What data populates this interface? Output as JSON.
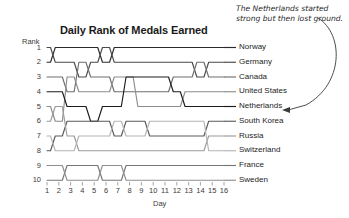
{
  "chart_data": {
    "type": "line",
    "subtype": "bump-chart",
    "title": "Daily Rank of Medals Earned",
    "xlabel": "Day",
    "ylabel": "Rank",
    "x": [
      1,
      2,
      3,
      4,
      5,
      6,
      7,
      8,
      9,
      10,
      11,
      12,
      13,
      14,
      15,
      16
    ],
    "xtick_labels": [
      "1",
      "2",
      "3",
      "4",
      "5",
      "6",
      "7",
      "8",
      "9",
      "10",
      "11",
      "12",
      "13",
      "14",
      "15",
      "16"
    ],
    "ytick_labels": [
      "1",
      "2",
      "3",
      "4",
      "5",
      "6",
      "7",
      "8",
      "9",
      "10"
    ],
    "ylim": [
      1,
      10
    ],
    "y_inverted": true,
    "grid": false,
    "legend": "right-inline-labels",
    "series": [
      {
        "name": "Norway",
        "color": "#2b2b2b",
        "final_rank": 1,
        "values": [
          2,
          1,
          1,
          1,
          1,
          2,
          1,
          1,
          1,
          1,
          1,
          1,
          1,
          1,
          1,
          1
        ]
      },
      {
        "name": "Germany",
        "color": "#4a4a4a",
        "final_rank": 2,
        "values": [
          1,
          2,
          2,
          3,
          2,
          1,
          2,
          2,
          2,
          2,
          2,
          2,
          2,
          3,
          2,
          2
        ]
      },
      {
        "name": "Canada",
        "color": "#6e6e6e",
        "final_rank": 3,
        "values": [
          3,
          3,
          4,
          2,
          3,
          3,
          4,
          4,
          4,
          4,
          4,
          3,
          3,
          2,
          3,
          3
        ]
      },
      {
        "name": "United States",
        "color": "#8c8c8c",
        "final_rank": 4,
        "values": [
          5,
          6,
          3,
          4,
          4,
          4,
          3,
          3,
          5,
          5,
          5,
          5,
          4,
          4,
          4,
          4
        ]
      },
      {
        "name": "Netherlands",
        "color": "#1c1c1c",
        "final_rank": 5,
        "values": [
          4,
          4,
          5,
          5,
          6,
          5,
          5,
          3,
          3,
          3,
          3,
          4,
          5,
          5,
          5,
          5
        ]
      },
      {
        "name": "South Korea",
        "color": "#5a5a5a",
        "final_rank": 6,
        "values": [
          8,
          7,
          6,
          6,
          6,
          6,
          7,
          6,
          6,
          7,
          7,
          7,
          7,
          7,
          6,
          6
        ]
      },
      {
        "name": "Russia",
        "color": "#9a9a9a",
        "final_rank": 7,
        "values": [
          6,
          5,
          7,
          8,
          8,
          8,
          8,
          8,
          8,
          8,
          8,
          8,
          8,
          8,
          7,
          7
        ]
      },
      {
        "name": "Switzerland",
        "color": "#b4b4b4",
        "final_rank": 8,
        "values": [
          7,
          8,
          8,
          7,
          7,
          7,
          6,
          7,
          7,
          6,
          6,
          6,
          6,
          6,
          8,
          8
        ]
      },
      {
        "name": "France",
        "color": "#767676",
        "final_rank": 9,
        "values": [
          10,
          10,
          9,
          9,
          9,
          10,
          10,
          9,
          9,
          9,
          9,
          9,
          9,
          9,
          9,
          9
        ]
      },
      {
        "name": "Sweden",
        "color": "#8f8f8f",
        "final_rank": 10,
        "values": [
          9,
          9,
          10,
          10,
          10,
          9,
          9,
          10,
          10,
          10,
          10,
          10,
          10,
          10,
          10,
          10
        ]
      }
    ],
    "annotation": {
      "text": "The Netherlands started strong but then lost ground.",
      "points_to": "Netherlands"
    }
  },
  "axes": {
    "rank_label": "Rank",
    "day_label": "Day"
  }
}
